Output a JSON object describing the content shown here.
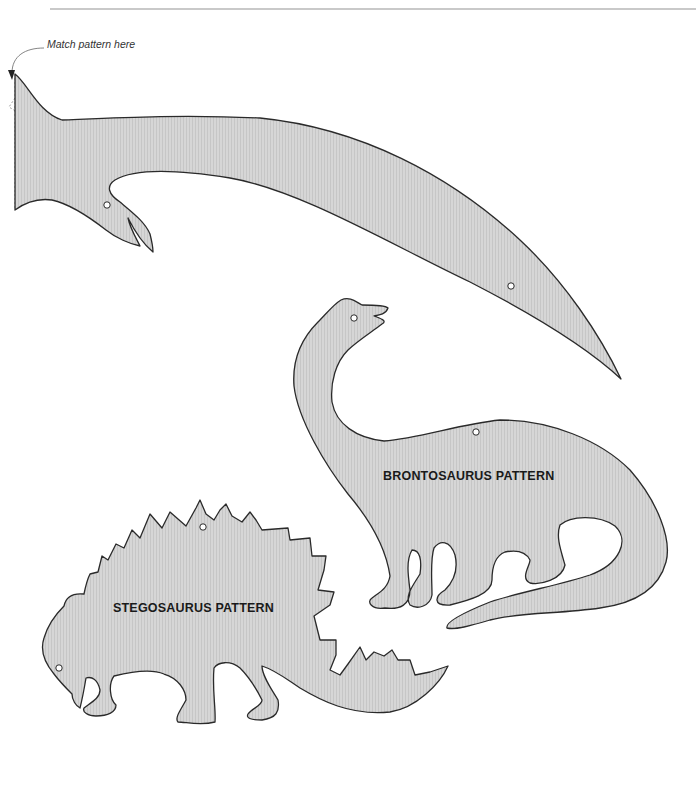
{
  "page": {
    "annotation": "Match pattern here",
    "colors": {
      "fill": "#d6d6d6",
      "hatch": "#c4c4c4",
      "outline": "#2a2a2a",
      "rule": "#c9c9c9",
      "fold_line": "#888888"
    }
  },
  "patterns": [
    {
      "id": "long-neck-part",
      "label": "",
      "holes": 2
    },
    {
      "id": "brontosaurus",
      "label": "BRONTOSAURUS PATTERN",
      "holes": 2
    },
    {
      "id": "stegosaurus",
      "label": "STEGOSAURUS PATTERN",
      "holes": 2
    }
  ]
}
